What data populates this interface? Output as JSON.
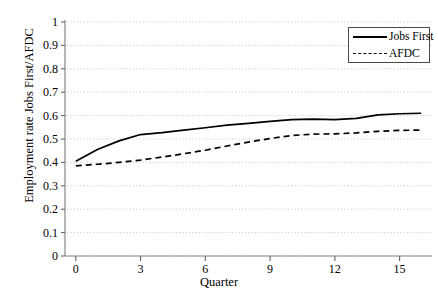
{
  "chart_data": {
    "type": "line",
    "title": "",
    "xlabel": "Quarter",
    "ylabel": "Employment rate Jobs First/AFDC",
    "xlim": [
      -0.5,
      16.5
    ],
    "ylim": [
      0,
      1
    ],
    "xticks": [
      0,
      3,
      6,
      9,
      12,
      15
    ],
    "yticks": [
      0,
      0.1,
      0.2,
      0.3,
      0.4,
      0.5,
      0.6,
      0.7,
      0.8,
      0.9,
      1
    ],
    "ytick_labels": [
      "0",
      "0.1",
      "0.2",
      "0.3",
      "0.4",
      "0.5",
      "0.6",
      "0.7",
      "0.8",
      "0.9",
      "1"
    ],
    "xtick_labels": [
      "0",
      "3",
      "6",
      "9",
      "12",
      "15"
    ],
    "grid": "horizontal-dotted",
    "legend_position": "top-right",
    "x": [
      0,
      1,
      2,
      3,
      4,
      5,
      6,
      7,
      8,
      9,
      10,
      11,
      12,
      13,
      14,
      15,
      16
    ],
    "series": [
      {
        "name": "Jobs First",
        "style": "solid",
        "color": "#000000",
        "values": [
          0.405,
          0.455,
          0.492,
          0.519,
          0.527,
          0.538,
          0.548,
          0.559,
          0.567,
          0.575,
          0.583,
          0.585,
          0.583,
          0.588,
          0.603,
          0.608,
          0.61
        ]
      },
      {
        "name": "AFDC",
        "style": "dashed",
        "color": "#000000",
        "values": [
          0.385,
          0.392,
          0.4,
          0.41,
          0.423,
          0.437,
          0.452,
          0.47,
          0.487,
          0.502,
          0.515,
          0.521,
          0.522,
          0.526,
          0.533,
          0.537,
          0.538
        ]
      }
    ]
  },
  "legend": {
    "items": [
      {
        "label": "Jobs First"
      },
      {
        "label": "AFDC"
      }
    ]
  },
  "axes": {
    "y_title": "Employment rate Jobs First/AFDC",
    "x_title": "Quarter"
  }
}
